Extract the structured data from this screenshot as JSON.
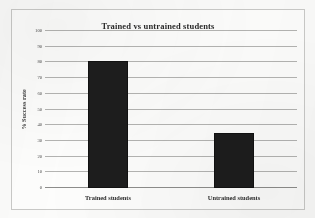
{
  "chart_data": {
    "type": "bar",
    "title": "Trained vs untrained students",
    "xlabel": "",
    "ylabel": "% Success rate",
    "categories": [
      "Trained students",
      "Untrained students"
    ],
    "values": [
      81,
      35
    ],
    "ylim": [
      0,
      100
    ],
    "ytick_step": 10,
    "yticks": [
      100,
      90,
      80,
      70,
      60,
      50,
      40,
      30,
      20,
      10,
      0
    ],
    "ytick_labels": [
      "100",
      "90",
      "80",
      "70",
      "60",
      "50",
      "40",
      "30",
      "20",
      "10",
      "0"
    ],
    "grid": true,
    "legend": false,
    "bar_color": "#1d1d1d",
    "gridline_color": "#b4b4b2",
    "background_color": "#fdfdfc",
    "border_color": "#c9c9c7",
    "title_color": "#2b2b2b"
  }
}
